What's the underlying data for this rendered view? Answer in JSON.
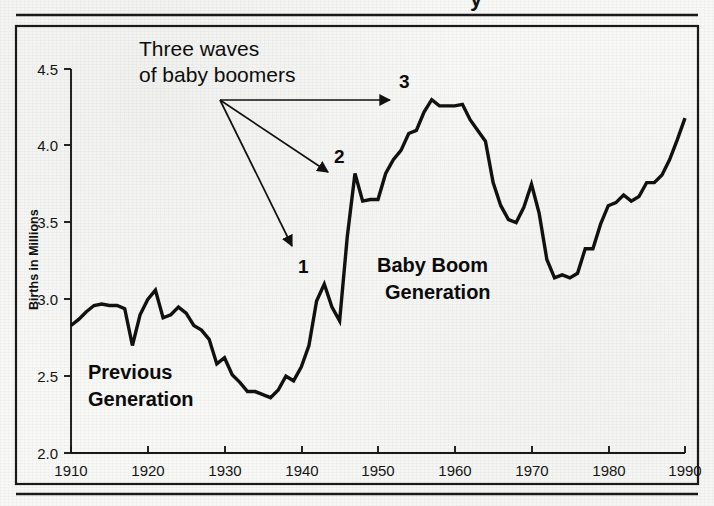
{
  "figure": {
    "background_color": "#f8f8f6",
    "ink_color": "#101010",
    "border_color": "#1a1a1a",
    "title_partial": "y"
  },
  "axes": {
    "y_axis_label": "Births in Millions",
    "y_ticks": [
      "4.5",
      "4.0",
      "3.5",
      "3.0",
      "2.5",
      "2.0"
    ],
    "y_tick_values": [
      4.5,
      4.0,
      3.5,
      3.0,
      2.5,
      2.0
    ],
    "x_ticks": [
      "1910",
      "1920",
      "1930",
      "1940",
      "1950",
      "1960",
      "1970",
      "1980",
      "1990"
    ],
    "x_tick_values": [
      1910,
      1920,
      1930,
      1940,
      1950,
      1960,
      1970,
      1980,
      1990
    ]
  },
  "annotations": {
    "callout_line1": "Three waves",
    "callout_line2": "of baby boomers",
    "wave_1": "1",
    "wave_2": "2",
    "wave_3": "3",
    "previous_line1": "Previous",
    "previous_line2": "Generation",
    "babyboom_line1": "Baby Boom",
    "babyboom_line2": "Generation"
  },
  "chart_data": {
    "type": "line",
    "title": "",
    "xlabel": "",
    "ylabel": "Births in Millions",
    "xlim": [
      1910,
      1990
    ],
    "ylim": [
      2.0,
      4.5
    ],
    "grid": false,
    "legend": "none",
    "series": [
      {
        "name": "Births in Millions",
        "x": [
          1910,
          1911,
          1912,
          1913,
          1914,
          1915,
          1916,
          1917,
          1918,
          1919,
          1920,
          1921,
          1922,
          1923,
          1924,
          1925,
          1926,
          1927,
          1928,
          1929,
          1930,
          1931,
          1932,
          1933,
          1934,
          1935,
          1936,
          1937,
          1938,
          1939,
          1940,
          1941,
          1942,
          1943,
          1944,
          1945,
          1946,
          1947,
          1948,
          1949,
          1950,
          1951,
          1952,
          1953,
          1954,
          1955,
          1956,
          1957,
          1958,
          1959,
          1960,
          1961,
          1962,
          1963,
          1964,
          1965,
          1966,
          1967,
          1968,
          1969,
          1970,
          1971,
          1972,
          1973,
          1974,
          1975,
          1976,
          1977,
          1978,
          1979,
          1980,
          1981,
          1982,
          1983,
          1984,
          1985,
          1986,
          1987,
          1988,
          1989,
          1990
        ],
        "y": [
          2.83,
          2.87,
          2.92,
          2.96,
          2.97,
          2.96,
          2.96,
          2.94,
          2.7,
          2.9,
          3.0,
          3.06,
          2.88,
          2.9,
          2.95,
          2.91,
          2.83,
          2.8,
          2.74,
          2.58,
          2.62,
          2.51,
          2.46,
          2.4,
          2.4,
          2.38,
          2.36,
          2.41,
          2.5,
          2.47,
          2.56,
          2.7,
          2.99,
          3.1,
          2.95,
          2.86,
          3.41,
          3.82,
          3.64,
          3.65,
          3.65,
          3.82,
          3.91,
          3.97,
          4.08,
          4.1,
          4.22,
          4.3,
          4.26,
          4.26,
          4.26,
          4.27,
          4.17,
          4.1,
          4.03,
          3.76,
          3.61,
          3.52,
          3.5,
          3.6,
          3.75,
          3.56,
          3.26,
          3.14,
          3.16,
          3.14,
          3.17,
          3.33,
          3.33,
          3.49,
          3.61,
          3.63,
          3.68,
          3.64,
          3.67,
          3.76,
          3.76,
          3.81,
          3.91,
          4.04,
          4.18
        ]
      }
    ],
    "marked_points": [
      {
        "label": "1",
        "x": 1943,
        "y": 3.1
      },
      {
        "label": "2",
        "x": 1947,
        "y": 3.82
      },
      {
        "label": "3",
        "x": 1957,
        "y": 4.3
      }
    ]
  }
}
